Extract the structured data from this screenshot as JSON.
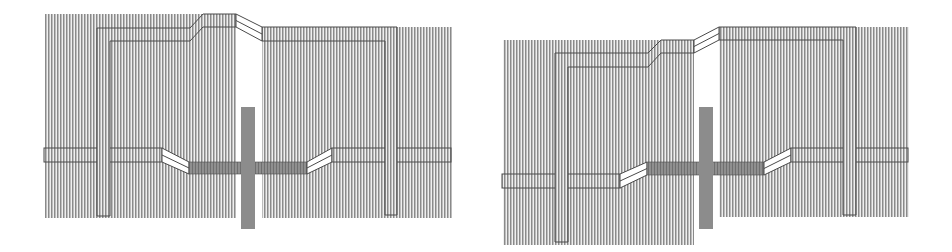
{
  "colors": {
    "background": "#ffffff",
    "hatch_dark": "#8a8a8a",
    "hatch_mid": "#bdbdbd",
    "hatch_light": "#efefef",
    "strip_dark": "#6f6f6f",
    "strip_mid": "#8f8f8f",
    "cross": "#8c8c8c",
    "outline": "#4a4a4a",
    "diagonal_fill": "#ffffff"
  },
  "panels": [
    {
      "name": "layout-left",
      "x_offset": 0,
      "hatch_regions": [
        {
          "x": 45,
          "y": 14,
          "w": 191,
          "h": 204
        },
        {
          "x": 262,
          "y": 27,
          "w": 190,
          "h": 191
        }
      ],
      "bottom_wire": {
        "segments": [
          {
            "type": "rect",
            "x": 44,
            "y": 148,
            "w": 118,
            "h": 14
          },
          {
            "type": "diagonal",
            "points": [
              [
                162,
                148
              ],
              [
                189,
                162
              ],
              [
                189,
                174
              ],
              [
                162,
                162
              ]
            ],
            "mid": [
              [
                162,
                155
              ],
              [
                189,
                168
              ]
            ]
          },
          {
            "type": "dark",
            "x": 189,
            "y": 162,
            "w": 118,
            "h": 12
          },
          {
            "type": "diagonal",
            "points": [
              [
                307,
                162
              ],
              [
                332,
                148
              ],
              [
                332,
                162
              ],
              [
                307,
                174
              ]
            ],
            "mid": [
              [
                307,
                168
              ],
              [
                332,
                155
              ]
            ]
          },
          {
            "type": "rect",
            "x": 332,
            "y": 148,
            "w": 119,
            "h": 14
          }
        ]
      },
      "top_wires": [
        {
          "points": [
            [
              97,
              216
            ],
            [
              97,
              28
            ],
            [
              190,
              28
            ],
            [
              203,
              14
            ],
            [
              236,
              14
            ],
            [
              236,
              27
            ],
            [
              203,
              27
            ],
            [
              190,
              41
            ],
            [
              110,
              41
            ],
            [
              110,
              216
            ]
          ]
        },
        {
          "points": [
            [
              262,
              27
            ],
            [
              397,
              27
            ],
            [
              397,
              215
            ],
            [
              385,
              215
            ],
            [
              385,
              41
            ],
            [
              262,
              41
            ]
          ]
        }
      ],
      "top_diagonal": {
        "points": [
          [
            236,
            14
          ],
          [
            262,
            27
          ],
          [
            262,
            41
          ],
          [
            236,
            27
          ]
        ],
        "mid": [
          [
            236,
            20.5
          ],
          [
            262,
            34
          ]
        ]
      },
      "cross": {
        "x": 241,
        "y": 107,
        "w": 14,
        "h": 122
      }
    },
    {
      "name": "layout-right",
      "x_offset": 476,
      "hatch_regions": [
        {
          "x": 503,
          "y": 40,
          "w": 191,
          "h": 205
        },
        {
          "x": 719,
          "y": 27,
          "w": 190,
          "h": 190
        }
      ],
      "bottom_wire": {
        "segments": [
          {
            "type": "rect",
            "x": 502,
            "y": 174,
            "w": 118,
            "h": 14
          },
          {
            "type": "diagonal",
            "points": [
              [
                620,
                174
              ],
              [
                647,
                162
              ],
              [
                647,
                175
              ],
              [
                620,
                188
              ]
            ],
            "mid": [
              [
                620,
                181
              ],
              [
                647,
                168.5
              ]
            ]
          },
          {
            "type": "dark",
            "x": 647,
            "y": 162,
            "w": 117,
            "h": 13
          },
          {
            "type": "diagonal",
            "points": [
              [
                764,
                162
              ],
              [
                791,
                148
              ],
              [
                791,
                162
              ],
              [
                764,
                175
              ]
            ],
            "mid": [
              [
                764,
                168.5
              ],
              [
                791,
                155
              ]
            ]
          },
          {
            "type": "rect",
            "x": 791,
            "y": 148,
            "w": 117,
            "h": 14
          }
        ]
      },
      "top_wires": [
        {
          "points": [
            [
              555,
              242
            ],
            [
              555,
              53
            ],
            [
              648,
              53
            ],
            [
              661,
              40
            ],
            [
              694,
              40
            ],
            [
              694,
              53
            ],
            [
              661,
              53
            ],
            [
              648,
              67
            ],
            [
              568,
              67
            ],
            [
              568,
              242
            ]
          ]
        },
        {
          "points": [
            [
              719,
              27
            ],
            [
              856,
              27
            ],
            [
              856,
              215
            ],
            [
              843,
              215
            ],
            [
              843,
              40
            ],
            [
              719,
              40
            ]
          ]
        }
      ],
      "top_diagonal": {
        "points": [
          [
            694,
            40
          ],
          [
            719,
            27
          ],
          [
            719,
            40
          ],
          [
            694,
            53
          ]
        ],
        "mid": [
          [
            694,
            46.5
          ],
          [
            719,
            33.5
          ]
        ]
      },
      "cross": {
        "x": 699,
        "y": 107,
        "w": 14,
        "h": 122
      }
    }
  ]
}
